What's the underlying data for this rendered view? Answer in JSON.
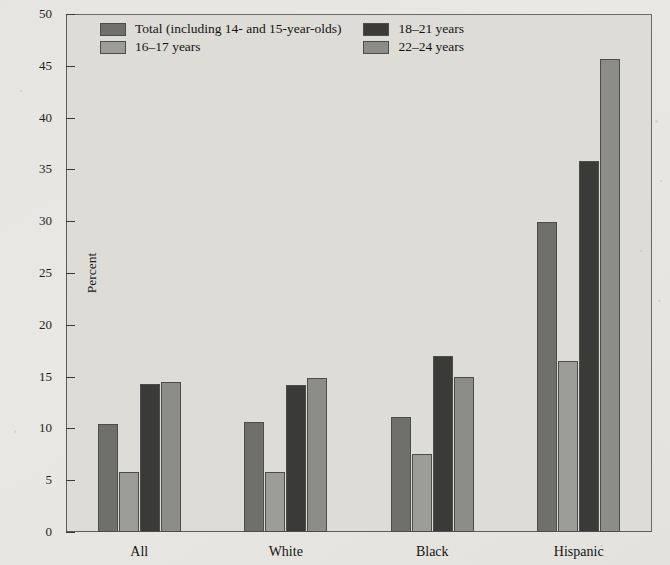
{
  "chart_data": {
    "type": "bar",
    "title": "",
    "xlabel": "",
    "ylabel": "Percent",
    "ylim": [
      0,
      50
    ],
    "yticks": [
      0,
      5,
      10,
      15,
      20,
      25,
      30,
      35,
      40,
      45,
      50
    ],
    "grid": false,
    "legend_position": "top-left-inside",
    "categories": [
      "All",
      "White",
      "Black",
      "Hispanic"
    ],
    "series": [
      {
        "name": "Total (including 14- and 15-year-olds)",
        "color": "#6f6f6c",
        "values": [
          10.4,
          10.6,
          11.1,
          29.9
        ]
      },
      {
        "name": "16–17 years",
        "color": "#9c9c98",
        "values": [
          5.8,
          5.8,
          7.5,
          16.5
        ]
      },
      {
        "name": "18–21 years",
        "color": "#3a3a38",
        "values": [
          14.3,
          14.2,
          17.0,
          35.8
        ]
      },
      {
        "name": "22–24 years",
        "color": "#8c8c88",
        "values": [
          14.5,
          14.9,
          15.0,
          45.7
        ]
      }
    ]
  }
}
